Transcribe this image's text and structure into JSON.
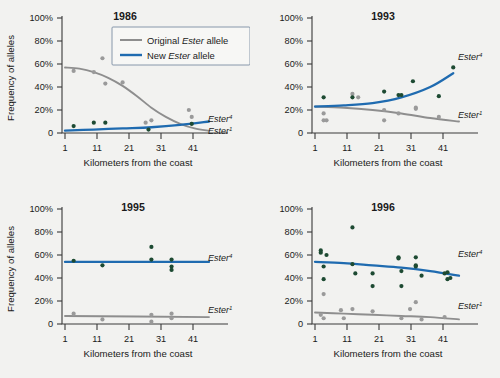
{
  "figure": {
    "background_color": "#f2f2f0",
    "axis_title_x": "Kilometers from the coast",
    "axis_title_y": "Frequency of alleles",
    "y_ticks": [
      "0",
      "20%",
      "40%",
      "60%",
      "80%",
      "100%"
    ],
    "x_ticks": [
      "1",
      "11",
      "21",
      "31",
      "41"
    ],
    "colors": {
      "original_allele_line": "#8e8e8e",
      "new_allele_line": "#1f6bb0",
      "original_allele_points": "#9a9a9a",
      "new_allele_points": "#1d4a32"
    }
  },
  "legend": {
    "position": "top-right of 1986 panel",
    "entries": [
      {
        "prefix": "Original ",
        "gene": "Ester",
        "suffix": " allele",
        "color": "#8e8e8e",
        "swatch": "gray-line-swatch"
      },
      {
        "prefix": "New ",
        "gene": "Ester",
        "suffix": " allele",
        "color": "#1f6bb0",
        "swatch": "blue-line-swatch"
      }
    ]
  },
  "series_labels": {
    "new_allele": {
      "base": "Ester",
      "sup": "4"
    },
    "original_allele": {
      "base": "Ester",
      "sup": "1"
    }
  },
  "chart_data": [
    {
      "type": "scatter",
      "title": "1986",
      "xlabel": "Kilometers from the coast",
      "ylabel": "Frequency of alleles",
      "xlim": [
        1,
        51
      ],
      "ylim": [
        0,
        100
      ],
      "grid": false,
      "legend": "inside-top-right",
      "series": [
        {
          "name": "Original Ester allele",
          "label": "Ester1",
          "color": "#8e8e8e",
          "fit_curve": [
            [
              1,
              57
            ],
            [
              6,
              56
            ],
            [
              11,
              53
            ],
            [
              16,
              48
            ],
            [
              21,
              41
            ],
            [
              26,
              32
            ],
            [
              31,
              22
            ],
            [
              36,
              14
            ],
            [
              41,
              8
            ],
            [
              46,
              4
            ],
            [
              51,
              2
            ]
          ],
          "points": [
            [
              4,
              54
            ],
            [
              11,
              53
            ],
            [
              14,
              65
            ],
            [
              15,
              43
            ],
            [
              21,
              44
            ],
            [
              29,
              9
            ],
            [
              31,
              11
            ],
            [
              44,
              20
            ],
            [
              45,
              14
            ],
            [
              45,
              8
            ]
          ]
        },
        {
          "name": "New Ester allele",
          "label": "Ester4",
          "color": "#1f6bb0",
          "fit_curve": [
            [
              1,
              2
            ],
            [
              11,
              3
            ],
            [
              21,
              4
            ],
            [
              31,
              5
            ],
            [
              41,
              7
            ],
            [
              51,
              10
            ]
          ],
          "points": [
            [
              4,
              6
            ],
            [
              11,
              9
            ],
            [
              15,
              9
            ],
            [
              30,
              3
            ],
            [
              45,
              8
            ]
          ]
        }
      ]
    },
    {
      "type": "scatter",
      "title": "1993",
      "xlabel": "Kilometers from the coast",
      "ylabel": "Frequency of alleles",
      "xlim": [
        1,
        51
      ],
      "ylim": [
        0,
        100
      ],
      "grid": false,
      "series": [
        {
          "name": "Original Ester allele",
          "label": "Ester1",
          "color": "#8e8e8e",
          "fit_curve": [
            [
              1,
              23
            ],
            [
              11,
              22
            ],
            [
              21,
              20
            ],
            [
              31,
              17
            ],
            [
              41,
              13
            ],
            [
              51,
              10
            ]
          ],
          "points": [
            [
              4,
              17
            ],
            [
              4,
              11
            ],
            [
              5,
              11
            ],
            [
              14,
              34
            ],
            [
              16,
              31
            ],
            [
              25,
              20
            ],
            [
              25,
              11
            ],
            [
              30,
              17
            ],
            [
              36,
              22
            ],
            [
              36,
              21
            ],
            [
              44,
              14
            ]
          ]
        },
        {
          "name": "New Ester allele",
          "label": "Ester4",
          "color": "#1f6bb0",
          "fit_curve": [
            [
              1,
              23
            ],
            [
              11,
              24
            ],
            [
              21,
              26
            ],
            [
              31,
              31
            ],
            [
              41,
              40
            ],
            [
              49,
              52
            ]
          ],
          "points": [
            [
              4,
              31
            ],
            [
              14,
              31
            ],
            [
              25,
              36
            ],
            [
              30,
              33
            ],
            [
              31,
              33
            ],
            [
              35,
              45
            ],
            [
              44,
              32
            ],
            [
              49,
              57
            ]
          ]
        }
      ]
    },
    {
      "type": "scatter",
      "title": "1995",
      "xlabel": "Kilometers from the coast",
      "ylabel": "Frequency of alleles",
      "xlim": [
        1,
        51
      ],
      "ylim": [
        0,
        100
      ],
      "grid": false,
      "series": [
        {
          "name": "Original Ester allele",
          "label": "Ester1",
          "color": "#8e8e8e",
          "fit_curve": [
            [
              1,
              7
            ],
            [
              51,
              6
            ]
          ],
          "points": [
            [
              4,
              9
            ],
            [
              14,
              4
            ],
            [
              31,
              8
            ],
            [
              31,
              2
            ],
            [
              38,
              9
            ],
            [
              38,
              5
            ]
          ]
        },
        {
          "name": "New Ester allele",
          "label": "Ester4",
          "color": "#1f6bb0",
          "fit_curve": [
            [
              1,
              54
            ],
            [
              51,
              54
            ]
          ],
          "points": [
            [
              4,
              55
            ],
            [
              14,
              51
            ],
            [
              31,
              67
            ],
            [
              31,
              56
            ],
            [
              38,
              56
            ],
            [
              38,
              50
            ],
            [
              38,
              47
            ]
          ]
        }
      ]
    },
    {
      "type": "scatter",
      "title": "1996",
      "xlabel": "Kilometers from the coast",
      "ylabel": "Frequency of alleles",
      "xlim": [
        1,
        51
      ],
      "ylim": [
        0,
        100
      ],
      "grid": false,
      "series": [
        {
          "name": "Original Ester allele",
          "label": "Ester1",
          "color": "#8e8e8e",
          "fit_curve": [
            [
              1,
              10
            ],
            [
              11,
              9
            ],
            [
              21,
              8
            ],
            [
              31,
              7
            ],
            [
              41,
              6
            ],
            [
              51,
              4
            ]
          ],
          "points": [
            [
              3,
              8
            ],
            [
              4,
              5
            ],
            [
              4,
              26
            ],
            [
              10,
              12
            ],
            [
              11,
              5
            ],
            [
              14,
              13
            ],
            [
              21,
              11
            ],
            [
              31,
              5
            ],
            [
              34,
              13
            ],
            [
              36,
              19
            ],
            [
              38,
              4
            ],
            [
              46,
              6
            ]
          ]
        },
        {
          "name": "New Ester allele",
          "label": "Ester4",
          "color": "#1f6bb0",
          "fit_curve": [
            [
              1,
              54
            ],
            [
              11,
              53
            ],
            [
              21,
              51
            ],
            [
              31,
              49
            ],
            [
              41,
              46
            ],
            [
              51,
              42
            ]
          ],
          "points": [
            [
              3,
              64
            ],
            [
              3,
              62
            ],
            [
              4,
              50
            ],
            [
              4,
              39
            ],
            [
              5,
              60
            ],
            [
              14,
              84
            ],
            [
              14,
              52
            ],
            [
              15,
              44
            ],
            [
              21,
              44
            ],
            [
              21,
              33
            ],
            [
              30,
              58
            ],
            [
              30,
              57
            ],
            [
              31,
              46
            ],
            [
              31,
              33
            ],
            [
              36,
              58
            ],
            [
              36,
              51
            ],
            [
              36,
              50
            ],
            [
              38,
              42
            ],
            [
              46,
              44
            ],
            [
              47,
              45
            ],
            [
              47,
              39
            ],
            [
              48,
              40
            ]
          ]
        }
      ]
    }
  ]
}
